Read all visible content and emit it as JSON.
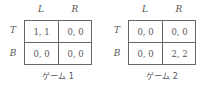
{
  "games": [
    {
      "caption": "ゲーム 1",
      "columns": [
        "L",
        "R"
      ],
      "rows": [
        "T",
        "B"
      ],
      "payoffs": [
        [
          "1, 1",
          "0, 0"
        ],
        [
          "0, 0",
          "0, 0"
        ]
      ]
    },
    {
      "caption": "ゲーム 2",
      "columns": [
        "L",
        "R"
      ],
      "rows": [
        "T",
        "B"
      ],
      "payoffs": [
        [
          "0, 0",
          "0, 0"
        ],
        [
          "0, 0",
          "2, 2"
        ]
      ]
    }
  ]
}
